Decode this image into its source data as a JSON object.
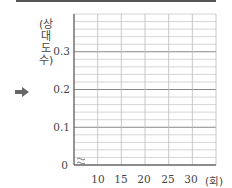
{
  "chart_data": {
    "type": "line",
    "title": "",
    "xlabel": "(회)",
    "ylabel": "(상대도수)",
    "x_ticks": [
      "10",
      "15",
      "20",
      "25",
      "30"
    ],
    "y_ticks": [
      "0",
      "0.1",
      "0.2",
      "0.3"
    ],
    "xlim": [
      5,
      35
    ],
    "ylim": [
      0,
      0.4
    ],
    "y_minor_step": 0.02,
    "grid": true,
    "axis_break": true,
    "series": [],
    "note": "Empty grid for drawing a relative frequency polygon"
  },
  "labels": {
    "ylabel_chars": [
      "(상",
      "대",
      "도",
      "수)"
    ],
    "origin": "0",
    "xunit": "(회)"
  },
  "colors": {
    "grid": "#bbbbbb",
    "major_grid": "#888888",
    "axis": "#666666",
    "arrow": "#666666"
  }
}
